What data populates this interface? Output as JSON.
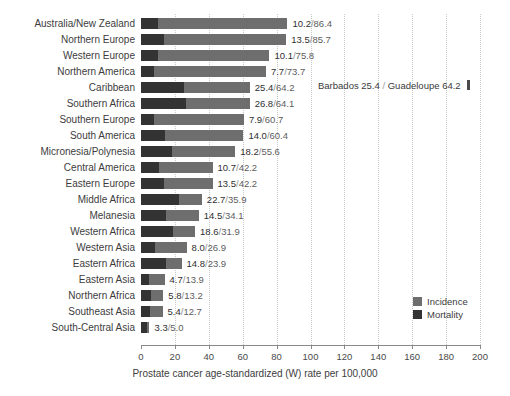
{
  "chart_data": {
    "type": "bar",
    "orientation": "horizontal",
    "title": "",
    "subtitle": "",
    "xlabel": "Prostate cancer age-standardized (W) rate per 100,000",
    "ylabel": "",
    "xlim": [
      0,
      200
    ],
    "xticks": [
      0,
      20,
      40,
      60,
      80,
      100,
      120,
      140,
      160,
      180,
      200
    ],
    "grid": true,
    "legend_position": "right-inside",
    "legend": [
      "Incidence",
      "Mortality"
    ],
    "colors": {
      "incidence": "#6e6e6e",
      "mortality": "#333333",
      "gridline": "#c8c8c8",
      "axis": "#8a8a8a",
      "text": "#3d3d3d",
      "background": "#ffffff"
    },
    "categories": [
      "Australia/New Zealand",
      "Northern Europe",
      "Western Europe",
      "Northern America",
      "Caribbean",
      "Southern Africa",
      "Southern Europe",
      "South America",
      "Micronesia/Polynesia",
      "Central America",
      "Eastern Europe",
      "Middle Africa",
      "Melanesia",
      "Western Africa",
      "Western Asia",
      "Eastern Africa",
      "Eastern Asia",
      "Northern Africa",
      "Southeast Asia",
      "South-Central Asia"
    ],
    "series": [
      {
        "name": "Incidence",
        "values": [
          86.4,
          85.7,
          75.8,
          73.7,
          64.2,
          64.1,
          60.7,
          60.4,
          55.6,
          42.2,
          42.2,
          35.9,
          34.1,
          31.9,
          26.9,
          23.9,
          13.9,
          13.2,
          12.7,
          5.0
        ]
      },
      {
        "name": "Mortality",
        "values": [
          10.2,
          13.5,
          10.1,
          7.7,
          25.4,
          26.8,
          7.9,
          14.0,
          18.2,
          10.7,
          13.5,
          22.7,
          14.5,
          18.6,
          8.0,
          14.8,
          4.7,
          5.8,
          5.4,
          3.3
        ]
      }
    ],
    "bar_labels": [
      "10.2/86.4",
      "13.5/85.7",
      "10.1/75.8",
      "7.7/73.7",
      "25.4/64.2",
      "26.8/64.1",
      "7.9/60.7",
      "14.0/60.4",
      "18.2/55.6",
      "10.7/42.2",
      "13.5/42.2",
      "22.7/35.9",
      "14.5/34.1",
      "18.6/31.9",
      "8.0/26.9",
      "14.8/23.9",
      "4.7/13.9",
      "5.8/13.2",
      "5.4/12.7",
      "3.3/5.0"
    ],
    "annotations": [
      {
        "text_mortality": "Barbados 25.4",
        "separator": "/",
        "text_incidence": "Guadeloupe 64.2",
        "full_text": "Barbados 25.4 / Guadeloupe 64.2",
        "attached_to_category": "Caribbean",
        "has_marker": true
      }
    ]
  }
}
